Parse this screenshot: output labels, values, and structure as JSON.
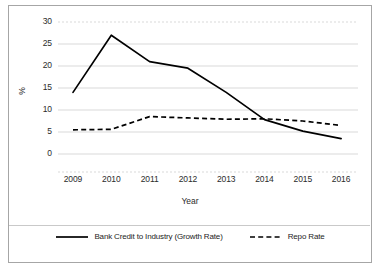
{
  "chart_data": {
    "type": "line",
    "title": "",
    "xlabel": "Year",
    "ylabel": "%",
    "categories": [
      "2009",
      "2010",
      "2011",
      "2012",
      "2013",
      "2014",
      "2015",
      "2016"
    ],
    "x": [
      2009,
      2010,
      2011,
      2012,
      2013,
      2014,
      2015,
      2016
    ],
    "ylim": [
      0,
      30
    ],
    "yticks": [
      0,
      5,
      10,
      15,
      20,
      25,
      30
    ],
    "ytick_labels": [
      "0",
      "5",
      "10",
      "15",
      "20",
      "25",
      "30"
    ],
    "grid": "horizontal",
    "legend_position": "bottom",
    "series": [
      {
        "name": "Bank Credit to Industry (Growth Rate)",
        "style": "solid",
        "color": "#000000",
        "values": [
          14.0,
          27.0,
          21.0,
          19.5,
          14.0,
          7.8,
          5.2,
          3.5
        ]
      },
      {
        "name": "Repo Rate",
        "style": "dashed",
        "color": "#000000",
        "values": [
          5.5,
          5.6,
          8.5,
          8.2,
          7.9,
          8.0,
          7.5,
          6.5
        ]
      }
    ]
  },
  "axis": {
    "y_title": "%",
    "x_title": "Year",
    "y_ticks": [
      "30",
      "25",
      "20",
      "15",
      "10",
      "5",
      "0"
    ],
    "x_ticks": [
      "2009",
      "2010",
      "2011",
      "2012",
      "2013",
      "2014",
      "2015",
      "2016"
    ]
  },
  "legend": {
    "items": [
      {
        "label": "Bank Credit to Industry (Growth Rate)",
        "style": "solid"
      },
      {
        "label": "Repo Rate",
        "style": "dashed"
      }
    ]
  },
  "colors": {
    "series_line": "#000000",
    "gridline": "#d9d9d9",
    "frame_border": "#a6a6a6",
    "text": "#2b2b2b",
    "background": "#ffffff"
  }
}
